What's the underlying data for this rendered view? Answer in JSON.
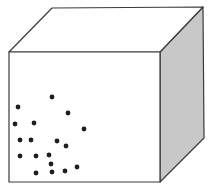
{
  "diagram": {
    "type": "cube-with-particles",
    "colors": {
      "background": "#ffffff",
      "front_face": "#ffffff",
      "top_face": "#ffffff",
      "side_face": "#c8c8c8",
      "edge": "#3a3a3a",
      "dot": "#1e1e1e"
    },
    "cube": {
      "front_face": [
        [
          9,
          52
        ],
        [
          160,
          52
        ],
        [
          160,
          182
        ],
        [
          9,
          182
        ]
      ],
      "top_face": [
        [
          9,
          52
        ],
        [
          52,
          8
        ],
        [
          203,
          7
        ],
        [
          160,
          52
        ]
      ],
      "side_face": [
        [
          160,
          52
        ],
        [
          203,
          7
        ],
        [
          204,
          138
        ],
        [
          160,
          182
        ]
      ]
    },
    "dots": [
      {
        "x": 52,
        "y": 97
      },
      {
        "x": 18,
        "y": 107
      },
      {
        "x": 68,
        "y": 113
      },
      {
        "x": 15,
        "y": 124
      },
      {
        "x": 34,
        "y": 123
      },
      {
        "x": 84,
        "y": 129
      },
      {
        "x": 20,
        "y": 140
      },
      {
        "x": 31,
        "y": 140
      },
      {
        "x": 57,
        "y": 141
      },
      {
        "x": 66,
        "y": 146
      },
      {
        "x": 20,
        "y": 156
      },
      {
        "x": 36,
        "y": 156
      },
      {
        "x": 49,
        "y": 155
      },
      {
        "x": 51,
        "y": 164
      },
      {
        "x": 36,
        "y": 173
      },
      {
        "x": 52,
        "y": 172
      },
      {
        "x": 65,
        "y": 171
      },
      {
        "x": 77,
        "y": 167
      }
    ],
    "dot_radius": 2.4
  }
}
